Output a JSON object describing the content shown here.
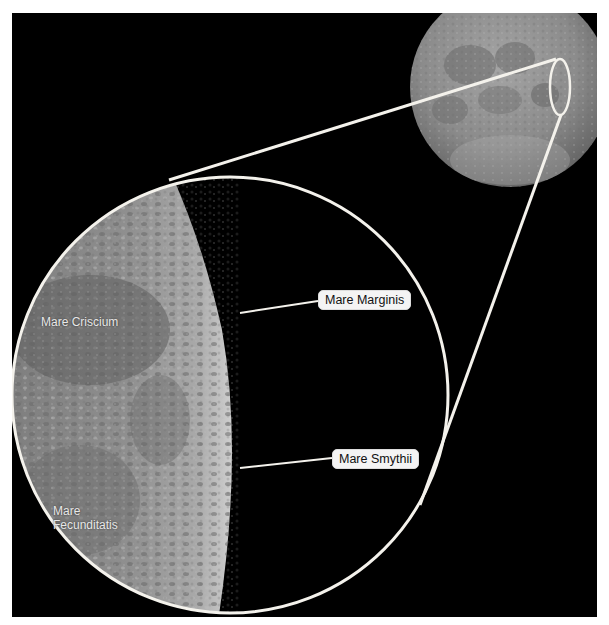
{
  "figure": {
    "colors": {
      "background": "#000000",
      "frame": "#ffffff",
      "outline": "#f4f2ec",
      "label_box": "#f4f4f4",
      "label_text": "#111111",
      "surface_label_text": "#e8e8e8",
      "moon_base": "#8a8a8a"
    }
  },
  "callouts": [
    {
      "label": "Mare Marginis"
    },
    {
      "label": "Mare Smythii"
    }
  ],
  "surface_labels": [
    {
      "label": "Mare Criscium"
    },
    {
      "label": "Mare\nFecunditatis",
      "line1": "Mare",
      "line2": "Fecunditatis"
    }
  ]
}
